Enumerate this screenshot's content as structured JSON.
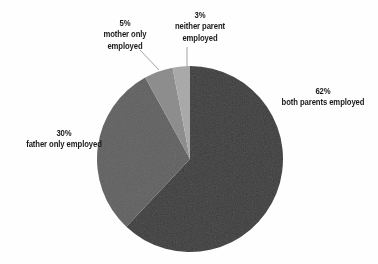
{
  "figure": {
    "background_color": "#fefefe",
    "clipped_header_artifact": "......."
  },
  "chart_data": {
    "type": "pie",
    "title": "",
    "subtitle": "",
    "xlabel": "",
    "ylabel": "",
    "legend_position": "none",
    "grid": false,
    "start_angle_deg": 0,
    "direction": "clockwise",
    "categories": [
      "both parents employed",
      "father  only employed",
      "mother only employed",
      "neither parent employed"
    ],
    "values": [
      62,
      30,
      5,
      3
    ],
    "value_unit": "%",
    "colors": [
      "#3a3a3a",
      "#5f5f5f",
      "#8a8a8a",
      "#a8a8a8"
    ],
    "slices": [
      {
        "name": "both parents employed",
        "percent_label": "62%",
        "value": 62,
        "color": "#3a3a3a",
        "label_lines": [
          "62%",
          "both parents employed"
        ]
      },
      {
        "name": "father only employed",
        "percent_label": "30%",
        "value": 30,
        "color": "#5f5f5f",
        "label_lines": [
          "30%",
          "father  only employed"
        ]
      },
      {
        "name": "mother only employed",
        "percent_label": "5%",
        "value": 5,
        "color": "#8a8a8a",
        "label_lines": [
          "5%",
          "mother only",
          "employed"
        ]
      },
      {
        "name": "neither parent employed",
        "percent_label": "3%",
        "value": 3,
        "color": "#a8a8a8",
        "label_lines": [
          "3%",
          "neither parent",
          "employed"
        ]
      }
    ]
  },
  "labels": {
    "both_parents": {
      "pct": "62%",
      "line1": "both parents employed"
    },
    "father_only": {
      "pct": "30%",
      "line1": "father  only employed"
    },
    "mother_only": {
      "pct": "5%",
      "line1": "mother only",
      "line2": "employed"
    },
    "neither_parent": {
      "pct": "3%",
      "line1": "neither parent",
      "line2": "employed"
    }
  }
}
